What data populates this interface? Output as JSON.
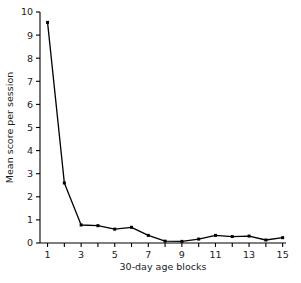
{
  "chart_data": {
    "type": "line",
    "title": "",
    "xlabel": "30-day age blocks",
    "ylabel": "Mean score per session",
    "x": [
      1,
      2,
      3,
      4,
      5,
      6,
      7,
      8,
      9,
      10,
      11,
      12,
      13,
      14,
      15
    ],
    "values": [
      9.55,
      2.6,
      0.78,
      0.75,
      0.6,
      0.68,
      0.33,
      0.08,
      0.07,
      0.17,
      0.33,
      0.28,
      0.3,
      0.13,
      0.23
    ],
    "series": [
      {
        "name": "Mean score per session",
        "values": [
          9.55,
          2.6,
          0.78,
          0.75,
          0.6,
          0.68,
          0.33,
          0.08,
          0.07,
          0.17,
          0.33,
          0.28,
          0.3,
          0.13,
          0.23
        ]
      }
    ],
    "xlim": [
      0.55,
      15.2
    ],
    "ylim": [
      0,
      10
    ],
    "xticks": [
      1,
      2,
      3,
      4,
      5,
      6,
      7,
      8,
      9,
      10,
      11,
      12,
      13,
      14,
      15
    ],
    "xtick_labels": [
      "1",
      "",
      "3",
      "",
      "5",
      "",
      "7",
      "",
      "9",
      "",
      "11",
      "",
      "13",
      "",
      "15"
    ],
    "yticks": [
      0,
      1,
      2,
      3,
      4,
      5,
      6,
      7,
      8,
      9,
      10
    ],
    "ytick_labels": [
      "0",
      "1",
      "2",
      "3",
      "4",
      "5",
      "6",
      "7",
      "8",
      "9",
      "10"
    ],
    "grid": false,
    "legend": "none",
    "line_color": "#000000",
    "marker": "square",
    "marker_color": "#000000",
    "axis_color": "#000000",
    "background_color": "#ffffff"
  }
}
